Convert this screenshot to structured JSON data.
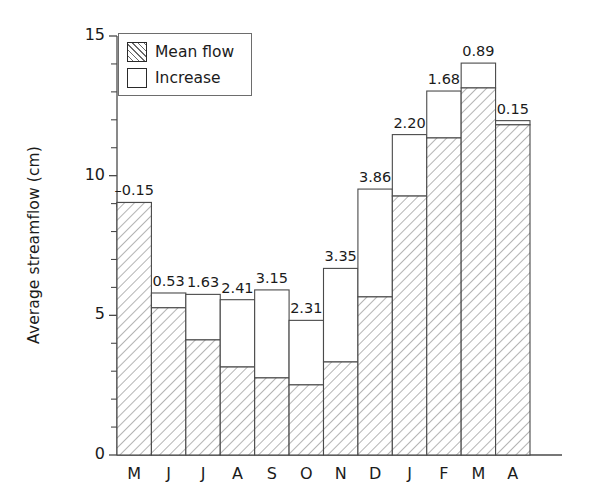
{
  "chart_data": {
    "type": "bar",
    "stacked": true,
    "title": "",
    "xlabel": "",
    "ylabel": "Average streamflow (cm)",
    "ylim": [
      0,
      15
    ],
    "yticks": [
      0,
      5,
      10,
      15
    ],
    "ytick_labels": [
      "0",
      "5",
      "10",
      "15"
    ],
    "minor_tick_interval": 1,
    "grid": false,
    "legend_position": "top-left",
    "categories": [
      "M",
      "J",
      "J",
      "A",
      "S",
      "O",
      "N",
      "D",
      "J",
      "F",
      "M",
      "A"
    ],
    "series": [
      {
        "name": "Mean flow",
        "fill": "hatched",
        "values": [
          9.04,
          5.27,
          4.12,
          3.15,
          2.76,
          2.51,
          3.33,
          5.66,
          9.27,
          11.35,
          13.14,
          11.82
        ]
      },
      {
        "name": "Increase",
        "fill": "white",
        "values": [
          -0.15,
          0.53,
          1.63,
          2.41,
          3.15,
          2.31,
          3.35,
          3.86,
          2.2,
          1.68,
          0.89,
          0.15
        ]
      }
    ],
    "totals": [
      8.89,
      5.8,
      5.75,
      5.56,
      5.91,
      4.82,
      6.68,
      9.52,
      11.47,
      13.03,
      14.03,
      11.97
    ],
    "bar_labels": [
      "–0.15",
      "0.53",
      "1.63",
      "2.41",
      "3.15",
      "2.31",
      "3.35",
      "3.86",
      "2.20",
      "1.68",
      "0.89",
      "0.15"
    ],
    "colors": {
      "line": "#4a4a4a",
      "hatch": "#6a6a6a",
      "fill": "#ffffff",
      "text": "#1b1b1b"
    }
  },
  "legend": {
    "items": [
      {
        "label": "Mean flow",
        "swatch": "hatched"
      },
      {
        "label": "Increase",
        "swatch": "white"
      }
    ]
  }
}
